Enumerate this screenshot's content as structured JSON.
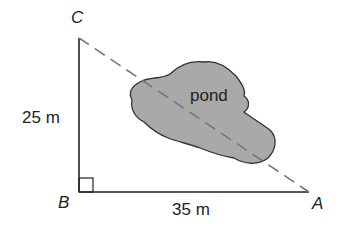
{
  "diagram": {
    "vertices": {
      "A": "A",
      "B": "B",
      "C": "C"
    },
    "side_bc": "25 m",
    "side_ba": "35 m",
    "region_label": "pond",
    "colors": {
      "line": "#222222",
      "dashed": "#777777",
      "pond_fill": "#a9a9a9",
      "pond_edge": "#333333"
    }
  }
}
